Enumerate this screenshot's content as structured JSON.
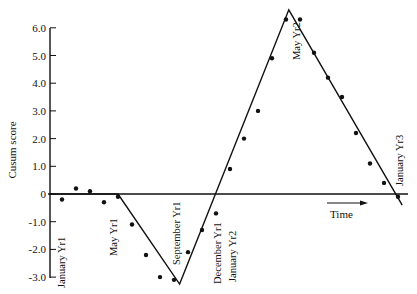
{
  "chart_data": {
    "type": "line",
    "title": "",
    "xlabel": "Time",
    "ylabel": "Cusum score",
    "ylim": [
      -3.0,
      6.0
    ],
    "yticks": [
      {
        "value": 6.0,
        "label": "6.0"
      },
      {
        "value": 5.0,
        "label": "5.0"
      },
      {
        "value": 4.0,
        "label": "4.0"
      },
      {
        "value": 3.0,
        "label": "3.0"
      },
      {
        "value": 2.0,
        "label": "2.0"
      },
      {
        "value": 1.0,
        "label": "1.0"
      },
      {
        "value": 0,
        "label": "0"
      },
      {
        "value": -1.0,
        "label": "-1.0"
      },
      {
        "value": -2.0,
        "label": "-2.0"
      },
      {
        "value": -3.0,
        "label": "-3.0"
      }
    ],
    "grid": false,
    "legend": null,
    "month_labels": [
      {
        "label": "January Yr1",
        "index": 1
      },
      {
        "label": "May Yr1",
        "index": 5
      },
      {
        "label": "September Yr1",
        "index": 9
      },
      {
        "label": "December Yr1",
        "index": 12
      },
      {
        "label": "January Yr2",
        "index": 13
      },
      {
        "label": "May Yr2",
        "index": 17
      },
      {
        "label": "January Yr3",
        "index": 25
      }
    ],
    "series": [
      {
        "name": "Monthly cusum points",
        "style": "scatter",
        "x": [
          1,
          2,
          3,
          4,
          5,
          6,
          7,
          8,
          9,
          10,
          11,
          12,
          13,
          14,
          15,
          16,
          17,
          18,
          19,
          20,
          21,
          22,
          23,
          24,
          25
        ],
        "values": [
          -0.2,
          0.2,
          0.1,
          -0.3,
          -0.1,
          -1.1,
          -2.2,
          -3.0,
          -3.1,
          -2.1,
          -1.3,
          -0.7,
          0.9,
          2.0,
          3.0,
          4.9,
          6.3,
          6.3,
          5.1,
          4.2,
          3.5,
          2.2,
          1.1,
          0.4,
          -0.1
        ]
      },
      {
        "name": "Segmented trend line",
        "style": "line",
        "x": [
          0,
          5,
          9.4,
          17.2,
          25.3
        ],
        "values": [
          0,
          0,
          -3.25,
          6.65,
          -0.4
        ]
      }
    ],
    "annotations": [
      {
        "text": "Time",
        "type": "arrow",
        "direction": "right"
      }
    ]
  }
}
